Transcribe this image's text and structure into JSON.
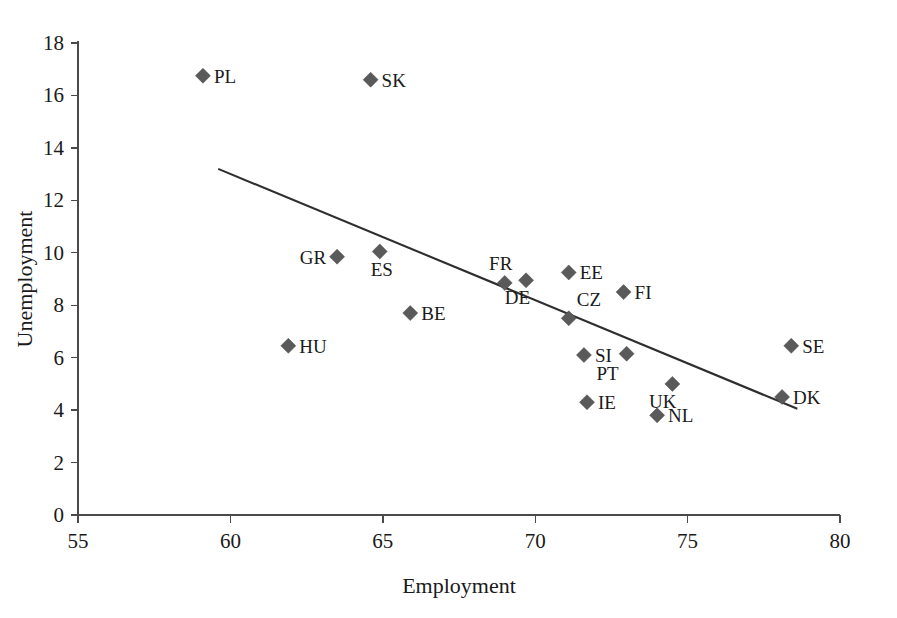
{
  "chart_data": {
    "type": "scatter",
    "title": "",
    "xlabel": "Employment",
    "ylabel": "Unemployment",
    "xlim": [
      55,
      80
    ],
    "ylim": [
      0,
      18
    ],
    "xticks": [
      55,
      60,
      65,
      70,
      75,
      80
    ],
    "yticks": [
      0,
      2,
      4,
      6,
      8,
      10,
      12,
      14,
      16,
      18
    ],
    "grid": false,
    "legend": "none",
    "marker_shape": "diamond",
    "marker_color": "#5a5a5a",
    "trend_line": {
      "label": "linear trend",
      "color": "#2e2e2e",
      "x_start": 59.6,
      "y_start": 13.2,
      "x_end": 78.6,
      "y_end": 4.05
    },
    "points": [
      {
        "label": "PL",
        "x": 59.1,
        "y": 16.75,
        "label_pos": "right"
      },
      {
        "label": "SK",
        "x": 64.6,
        "y": 16.6,
        "label_pos": "right"
      },
      {
        "label": "GR",
        "x": 63.5,
        "y": 9.85,
        "label_pos": "left"
      },
      {
        "label": "ES",
        "x": 64.9,
        "y": 10.05,
        "label_pos": "below"
      },
      {
        "label": "FR",
        "x": 69.0,
        "y": 8.85,
        "label_pos": "above-left"
      },
      {
        "label": "DE",
        "x": 69.7,
        "y": 8.95,
        "label_pos": "below-right"
      },
      {
        "label": "EE",
        "x": 71.1,
        "y": 9.25,
        "label_pos": "right"
      },
      {
        "label": "FI",
        "x": 72.9,
        "y": 8.5,
        "label_pos": "right"
      },
      {
        "label": "BE",
        "x": 65.9,
        "y": 7.7,
        "label_pos": "right"
      },
      {
        "label": "CZ",
        "x": 71.1,
        "y": 7.5,
        "label_pos": "above-right"
      },
      {
        "label": "HU",
        "x": 61.9,
        "y": 6.45,
        "label_pos": "right"
      },
      {
        "label": "SE",
        "x": 78.4,
        "y": 6.45,
        "label_pos": "right"
      },
      {
        "label": "SI",
        "x": 71.6,
        "y": 6.1,
        "label_pos": "right"
      },
      {
        "label": "PT",
        "x": 73.0,
        "y": 6.15,
        "label_pos": "below-left"
      },
      {
        "label": "UK",
        "x": 74.5,
        "y": 5.0,
        "label_pos": "below-right"
      },
      {
        "label": "DK",
        "x": 78.1,
        "y": 4.5,
        "label_pos": "right"
      },
      {
        "label": "IE",
        "x": 71.7,
        "y": 4.3,
        "label_pos": "right"
      },
      {
        "label": "NL",
        "x": 74.0,
        "y": 3.8,
        "label_pos": "right"
      }
    ]
  }
}
